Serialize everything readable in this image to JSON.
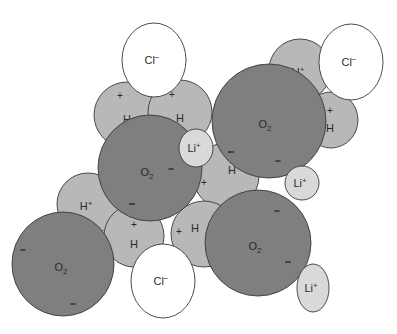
{
  "diagram": {
    "colors": {
      "oxygen": "#7f7f7f",
      "hydrogen": "#b8b8b8",
      "lithium": "#d9d9d9",
      "chloride": "#ffffff",
      "stroke": "#3a3a3a"
    },
    "particles": [
      {
        "id": "h-upper-left",
        "type": "hydrogen",
        "cx": 127,
        "cy": 115,
        "rx": 33,
        "ry": 33,
        "label": "H",
        "sup": "",
        "charge_mark": "+",
        "charge_dx": -7,
        "charge_dy": -20,
        "label_dx": 0,
        "label_dy": 4
      },
      {
        "id": "h-upper-right",
        "type": "hydrogen",
        "cx": 180,
        "cy": 112,
        "rx": 32,
        "ry": 32,
        "label": "H",
        "sup": "",
        "charge_mark": "+",
        "charge_dx": -8,
        "charge_dy": -18,
        "label_dx": 0,
        "label_dy": 6
      },
      {
        "id": "cl-top",
        "type": "chloride",
        "cx": 154,
        "cy": 60,
        "rx": 32,
        "ry": 37,
        "label": "Cl",
        "sup": "−",
        "charge_mark": "",
        "label_dx": -2,
        "label_dy": 0
      },
      {
        "id": "h-plus-top-right",
        "type": "hydrogen",
        "cx": 300,
        "cy": 70,
        "rx": 31,
        "ry": 31,
        "label": "H",
        "sup": "+",
        "charge_mark": "",
        "label_dx": -2,
        "label_dy": 2
      },
      {
        "id": "h-top-right-lower",
        "type": "hydrogen",
        "cx": 331,
        "cy": 120,
        "rx": 27,
        "ry": 28,
        "label": "H",
        "sup": "",
        "charge_mark": "+",
        "charge_dx": -1,
        "charge_dy": -10,
        "label_dx": -1,
        "label_dy": 8
      },
      {
        "id": "cl-top-right",
        "type": "chloride",
        "cx": 351,
        "cy": 62,
        "rx": 32,
        "ry": 38,
        "label": "Cl",
        "sup": "−",
        "charge_mark": "",
        "label_dx": -2,
        "label_dy": 0
      },
      {
        "id": "h-plus-left",
        "type": "hydrogen",
        "cx": 88,
        "cy": 204,
        "rx": 31,
        "ry": 31,
        "label": "H",
        "sup": "+",
        "charge_mark": "",
        "label_dx": -2,
        "label_dy": 2
      },
      {
        "id": "h-left-lower",
        "type": "hydrogen",
        "cx": 134,
        "cy": 236,
        "rx": 30,
        "ry": 31,
        "label": "H",
        "sup": "",
        "charge_mark": "+",
        "charge_dx": 0,
        "charge_dy": -12,
        "label_dx": 0,
        "label_dy": 8
      },
      {
        "id": "h-center-mid",
        "type": "hydrogen",
        "cx": 226,
        "cy": 176,
        "rx": 33,
        "ry": 33,
        "label": "H",
        "sup": "",
        "charge_mark": "+",
        "charge_dx": -22,
        "charge_dy": 6,
        "label_dx": 6,
        "label_dy": -6
      },
      {
        "id": "h-bottom-center",
        "type": "hydrogen",
        "cx": 204,
        "cy": 234,
        "rx": 33,
        "ry": 33,
        "label": "H",
        "sup": "",
        "charge_mark": "+",
        "charge_dx": -25,
        "charge_dy": -3,
        "label_dx": -9,
        "label_dy": -6
      },
      {
        "id": "o2-center-left",
        "type": "oxygen",
        "cx": 150,
        "cy": 168,
        "rx": 52,
        "ry": 53,
        "label": "O",
        "sub": "2",
        "minus_marks": [
          {
            "dx": 21,
            "dy": 1,
            "w": 5
          },
          {
            "dx": -18,
            "dy": 36,
            "w": 6
          }
        ],
        "label_dx": -3,
        "label_dy": 4
      },
      {
        "id": "o2-right",
        "type": "oxygen",
        "cx": 269,
        "cy": 121,
        "rx": 57,
        "ry": 57,
        "label": "O",
        "sub": "2",
        "minus_marks": [
          {
            "dx": -38,
            "dy": 31,
            "w": 6
          },
          {
            "dx": 9,
            "dy": 40,
            "w": 5
          }
        ],
        "label_dx": -4,
        "label_dy": 3
      },
      {
        "id": "o2-bottom-left",
        "type": "oxygen",
        "cx": 63,
        "cy": 264,
        "rx": 51,
        "ry": 52,
        "label": "O",
        "sub": "2",
        "minus_marks": [
          {
            "dx": -40,
            "dy": -14,
            "w": 5
          },
          {
            "dx": 10,
            "dy": 40,
            "w": 5
          }
        ],
        "label_dx": -2,
        "label_dy": 3
      },
      {
        "id": "o2-bottom-right",
        "type": "oxygen",
        "cx": 258,
        "cy": 243,
        "rx": 53,
        "ry": 53,
        "label": "O",
        "sub": "2",
        "minus_marks": [
          {
            "dx": 19,
            "dy": -32,
            "w": 5
          },
          {
            "dx": 30,
            "dy": 19,
            "w": 6
          }
        ],
        "label_dx": -3,
        "label_dy": 3
      },
      {
        "id": "li-center",
        "type": "lithium",
        "cx": 196,
        "cy": 148,
        "rx": 17,
        "ry": 19,
        "label": "Li",
        "sup": "+",
        "charge_mark": "",
        "label_dx": -2,
        "label_dy": 0
      },
      {
        "id": "li-right",
        "type": "lithium",
        "cx": 302,
        "cy": 183,
        "rx": 17,
        "ry": 17,
        "label": "Li",
        "sup": "+",
        "charge_mark": "",
        "label_dx": -2,
        "label_dy": 0
      },
      {
        "id": "cl-bottom",
        "type": "chloride",
        "cx": 163,
        "cy": 281,
        "rx": 32,
        "ry": 37,
        "label": "Cl",
        "sup": "−",
        "charge_mark": "",
        "label_dx": -2,
        "label_dy": 0
      },
      {
        "id": "li-bottom",
        "type": "lithium",
        "cx": 313,
        "cy": 288,
        "rx": 16,
        "ry": 24,
        "label": "Li",
        "sup": "+",
        "charge_mark": "",
        "label_dx": -2,
        "label_dy": 0
      }
    ]
  }
}
